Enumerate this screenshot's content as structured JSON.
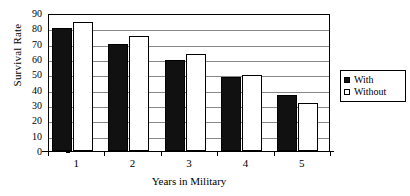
{
  "chart_data": {
    "type": "bar",
    "title": "",
    "subtitle": "",
    "categories": [
      "1",
      "2",
      "3",
      "4",
      "5"
    ],
    "series": [
      {
        "name": "With",
        "values": [
          80,
          70,
          59.5,
          48.5,
          36.5
        ]
      },
      {
        "name": "Without",
        "values": [
          84,
          75,
          63,
          49.5,
          31
        ]
      }
    ],
    "xlabel": "Years in Military",
    "ylabel": "Survival Rate",
    "ylim": [
      0,
      90
    ],
    "ytick_labels": [
      "0",
      "10",
      "20",
      "30",
      "40",
      "50",
      "60",
      "70",
      "80",
      "90"
    ],
    "ytick_values": [
      0,
      10,
      20,
      30,
      40,
      50,
      60,
      70,
      80,
      90
    ],
    "grid": "horizontal",
    "legend_position": "right",
    "annotations": []
  },
  "legend": {
    "entries": [
      {
        "label": "With",
        "swatch": "filled-square-swatch"
      },
      {
        "label": "Without",
        "swatch": "hollow-square-swatch"
      }
    ]
  },
  "colors": {
    "with_series": "#111111",
    "without_series": "#ffffff",
    "axis": "#000000",
    "gridline": "#888888",
    "background": "#ffffff"
  }
}
